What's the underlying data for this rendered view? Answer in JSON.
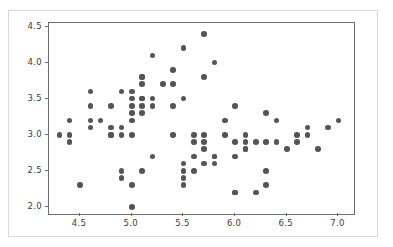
{
  "figure": {
    "background_color": "#ffffff",
    "frame_color": "#d9d9d9",
    "axes_color": "#6e6e6e",
    "marker_color": "#555555"
  },
  "chart_data": {
    "type": "scatter",
    "title": "",
    "xlabel": "",
    "ylabel": "",
    "xlim": [
      4.2,
      7.15
    ],
    "ylim": [
      1.9,
      4.55
    ],
    "xticks": [
      4.5,
      5.0,
      5.5,
      6.0,
      6.5,
      7.0
    ],
    "yticks": [
      2.0,
      2.5,
      3.0,
      3.5,
      4.0,
      4.5
    ],
    "xtick_labels": [
      "4.5",
      "5.0",
      "5.5",
      "6.0",
      "6.5",
      "7.0"
    ],
    "ytick_labels": [
      "2.0",
      "2.5",
      "3.0",
      "3.5",
      "4.0",
      "4.5"
    ],
    "grid": false,
    "legend": null,
    "marker": "circle",
    "marker_size": 5.6,
    "marker_color": "#555555",
    "n_points": 136,
    "points": [
      [
        4.3,
        3.0
      ],
      [
        4.4,
        3.2
      ],
      [
        4.4,
        3.0
      ],
      [
        4.4,
        2.9
      ],
      [
        4.5,
        2.3
      ],
      [
        4.6,
        3.6
      ],
      [
        4.6,
        3.4
      ],
      [
        4.6,
        3.2
      ],
      [
        4.6,
        3.1
      ],
      [
        4.7,
        3.2
      ],
      [
        4.8,
        3.4
      ],
      [
        4.8,
        3.1
      ],
      [
        4.8,
        3.0
      ],
      [
        4.8,
        3.0
      ],
      [
        4.9,
        3.6
      ],
      [
        4.9,
        3.1
      ],
      [
        4.9,
        3.0
      ],
      [
        4.9,
        2.4
      ],
      [
        4.9,
        2.5
      ],
      [
        5.0,
        3.6
      ],
      [
        5.0,
        3.5
      ],
      [
        5.0,
        3.4
      ],
      [
        5.0,
        3.3
      ],
      [
        5.0,
        3.2
      ],
      [
        5.0,
        3.0
      ],
      [
        5.0,
        2.3
      ],
      [
        5.0,
        2.0
      ],
      [
        5.1,
        3.8
      ],
      [
        5.1,
        3.7
      ],
      [
        5.1,
        3.5
      ],
      [
        5.1,
        3.5
      ],
      [
        5.1,
        3.4
      ],
      [
        5.1,
        3.3
      ],
      [
        5.1,
        3.8
      ],
      [
        5.1,
        2.5
      ],
      [
        5.2,
        4.1
      ],
      [
        5.2,
        3.5
      ],
      [
        5.2,
        3.4
      ],
      [
        5.2,
        2.7
      ],
      [
        5.3,
        3.7
      ],
      [
        5.4,
        3.9
      ],
      [
        5.4,
        3.7
      ],
      [
        5.4,
        3.4
      ],
      [
        5.4,
        3.0
      ],
      [
        5.5,
        4.2
      ],
      [
        5.5,
        3.5
      ],
      [
        5.5,
        2.6
      ],
      [
        5.5,
        2.5
      ],
      [
        5.5,
        2.4
      ],
      [
        5.5,
        2.3
      ],
      [
        5.6,
        3.0
      ],
      [
        5.6,
        2.9
      ],
      [
        5.6,
        2.7
      ],
      [
        5.6,
        2.5
      ],
      [
        5.7,
        4.4
      ],
      [
        5.7,
        3.8
      ],
      [
        5.7,
        3.0
      ],
      [
        5.7,
        2.9
      ],
      [
        5.7,
        2.8
      ],
      [
        5.7,
        2.6
      ],
      [
        5.8,
        4.0
      ],
      [
        5.8,
        2.7
      ],
      [
        5.8,
        2.7
      ],
      [
        5.8,
        2.6
      ],
      [
        5.9,
        3.2
      ],
      [
        5.9,
        3.0
      ],
      [
        6.0,
        3.4
      ],
      [
        6.0,
        2.9
      ],
      [
        6.0,
        2.7
      ],
      [
        6.0,
        2.2
      ],
      [
        6.0,
        2.2
      ],
      [
        6.1,
        3.0
      ],
      [
        6.1,
        2.9
      ],
      [
        6.1,
        2.8
      ],
      [
        6.1,
        2.8
      ],
      [
        6.2,
        2.9
      ],
      [
        6.2,
        2.2
      ],
      [
        6.3,
        3.3
      ],
      [
        6.3,
        2.9
      ],
      [
        6.3,
        2.5
      ],
      [
        6.3,
        2.3
      ],
      [
        6.4,
        3.2
      ],
      [
        6.4,
        2.9
      ],
      [
        6.5,
        2.8
      ],
      [
        6.6,
        3.0
      ],
      [
        6.6,
        2.9
      ],
      [
        6.7,
        3.1
      ],
      [
        6.7,
        3.0
      ],
      [
        6.8,
        2.8
      ],
      [
        6.9,
        3.1
      ],
      [
        7.0,
        3.2
      ]
    ]
  }
}
